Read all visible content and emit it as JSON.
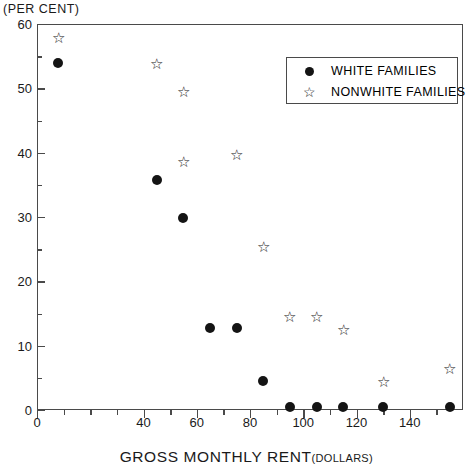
{
  "unit_caption": "(PER CENT)",
  "axis_title": {
    "main": "GROSS MONTHLY RENT",
    "sub": "(DOLLARS)"
  },
  "legend": {
    "entries": [
      {
        "marker": "filled-circle",
        "label": "WHITE FAMILIES"
      },
      {
        "marker": "open-star",
        "label": "NONWHITE FAMILIES"
      }
    ]
  },
  "chart_data": {
    "type": "scatter",
    "title": "",
    "xlabel": "GROSS MONTHLY RENT (DOLLARS)",
    "ylabel": "(PER CENT)",
    "xlim": [
      0,
      160
    ],
    "ylim": [
      0,
      60
    ],
    "grid": false,
    "legend_position": "upper-right",
    "x_major_ticks": [
      0,
      40,
      60,
      80,
      100,
      120,
      140
    ],
    "x_tick_labels": [
      "0",
      "40",
      "60",
      "80",
      "100",
      "120",
      "140"
    ],
    "x_minor_ticks": [
      10,
      20,
      30,
      50,
      70,
      90,
      110,
      130,
      150
    ],
    "y_major_ticks": [
      0,
      10,
      20,
      30,
      40,
      50,
      60
    ],
    "y_tick_labels": [
      "0",
      "10",
      "20",
      "30",
      "40",
      "50",
      "60"
    ],
    "y_minor_ticks": [
      5,
      15,
      25,
      35,
      45,
      55
    ],
    "series": [
      {
        "name": "WHITE FAMILIES",
        "marker": "filled-circle",
        "color": "#141414",
        "points": [
          {
            "x": 8,
            "y": 53.9
          },
          {
            "x": 45,
            "y": 35.7
          },
          {
            "x": 55,
            "y": 29.8
          },
          {
            "x": 65,
            "y": 12.7
          },
          {
            "x": 75,
            "y": 12.7
          },
          {
            "x": 85,
            "y": 4.5
          },
          {
            "x": 95,
            "y": 0.5
          },
          {
            "x": 105,
            "y": 0.4
          },
          {
            "x": 115,
            "y": 0.4
          },
          {
            "x": 130,
            "y": 0.4
          },
          {
            "x": 155,
            "y": 0.4
          }
        ]
      },
      {
        "name": "NONWHITE FAMILIES",
        "marker": "open-star",
        "color": "#141414",
        "points": [
          {
            "x": 8,
            "y": 57.8
          },
          {
            "x": 45,
            "y": 53.8
          },
          {
            "x": 55,
            "y": 49.5
          },
          {
            "x": 55,
            "y": 38.5
          },
          {
            "x": 75,
            "y": 39.6
          },
          {
            "x": 85,
            "y": 25.3
          },
          {
            "x": 95,
            "y": 14.4
          },
          {
            "x": 105,
            "y": 14.4
          },
          {
            "x": 115,
            "y": 12.4
          },
          {
            "x": 130,
            "y": 4.3
          },
          {
            "x": 155,
            "y": 6.3
          }
        ]
      }
    ]
  }
}
